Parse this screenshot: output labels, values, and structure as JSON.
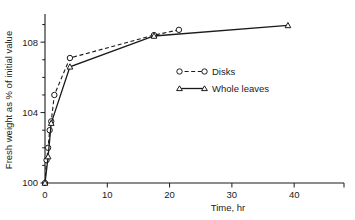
{
  "chart_data": {
    "type": "line",
    "title": "",
    "xlabel": "Time, hr",
    "ylabel": "Fresh weight as % of initial value",
    "xlim": [
      0,
      48
    ],
    "ylim": [
      100,
      109.6
    ],
    "xticks": [
      0,
      10,
      20,
      30,
      40
    ],
    "xticklabels": [
      "0",
      "10",
      "20",
      "30",
      "40"
    ],
    "yticks": [
      100,
      104,
      108
    ],
    "yticklabels": [
      "100",
      "104",
      "108"
    ],
    "y_minor_ticks": [
      101,
      102,
      103,
      105,
      106,
      107,
      109
    ],
    "grid": false,
    "legend_position": "center-right",
    "series": [
      {
        "name": "Disks",
        "marker": "circle-open",
        "linestyle": "dashed",
        "points": [
          {
            "x": 0.0,
            "y": 100.0
          },
          {
            "x": 0.25,
            "y": 101.3
          },
          {
            "x": 0.5,
            "y": 102.0
          },
          {
            "x": 0.75,
            "y": 103.0
          },
          {
            "x": 1.0,
            "y": 103.5
          },
          {
            "x": 1.5,
            "y": 105.0
          },
          {
            "x": 4.0,
            "y": 107.1
          },
          {
            "x": 17.5,
            "y": 108.4
          },
          {
            "x": 21.5,
            "y": 108.7
          }
        ]
      },
      {
        "name": "Whole leaves",
        "marker": "triangle-open",
        "linestyle": "solid",
        "points": [
          {
            "x": 0.0,
            "y": 100.0
          },
          {
            "x": 0.5,
            "y": 101.5
          },
          {
            "x": 1.0,
            "y": 103.4
          },
          {
            "x": 4.0,
            "y": 106.6
          },
          {
            "x": 17.5,
            "y": 108.35
          },
          {
            "x": 39.0,
            "y": 108.95
          }
        ]
      }
    ]
  },
  "legend": {
    "entries": [
      {
        "label": "Disks",
        "marker": "circle-open",
        "linestyle": "dashed"
      },
      {
        "label": "Whole leaves",
        "marker": "triangle-open",
        "linestyle": "solid"
      }
    ]
  }
}
